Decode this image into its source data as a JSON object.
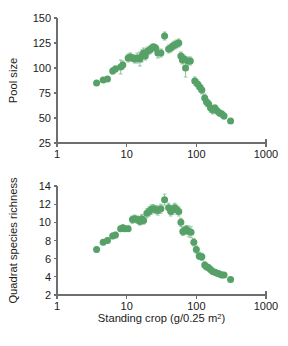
{
  "figure": {
    "background": "#ffffff",
    "marker_color": "#56a167",
    "error_bar_color": "#7fbb8c",
    "axis_color": "#6e6e6e"
  },
  "chart_data": [
    {
      "type": "scatter",
      "panel": "top",
      "title": "",
      "xlabel": "",
      "ylabel": "Pool size",
      "xscale": "log",
      "yscale": "linear",
      "xlim": [
        1,
        1000
      ],
      "ylim": [
        25,
        150
      ],
      "xticks": [
        1,
        10,
        100,
        1000
      ],
      "xticklabels": [
        "1",
        "10",
        "100",
        "1000"
      ],
      "yticks": [
        25,
        50,
        75,
        100,
        125,
        150
      ],
      "yticklabels": [
        "25",
        "50",
        "75",
        "100",
        "125",
        "150"
      ],
      "grid": false,
      "legend": false,
      "error_bars": "vertical",
      "points": [
        {
          "x": 3.7,
          "y": 85,
          "yerr": 2
        },
        {
          "x": 4.6,
          "y": 88,
          "yerr": 2
        },
        {
          "x": 5.3,
          "y": 89,
          "yerr": 2
        },
        {
          "x": 6.3,
          "y": 97,
          "yerr": 3
        },
        {
          "x": 6.9,
          "y": 99,
          "yerr": 3
        },
        {
          "x": 8.2,
          "y": 101,
          "yerr": 7
        },
        {
          "x": 8.8,
          "y": 103,
          "yerr": 4
        },
        {
          "x": 10.5,
          "y": 110,
          "yerr": 4
        },
        {
          "x": 11.3,
          "y": 111,
          "yerr": 4
        },
        {
          "x": 12.1,
          "y": 110,
          "yerr": 3
        },
        {
          "x": 13.0,
          "y": 109,
          "yerr": 4
        },
        {
          "x": 14.2,
          "y": 110,
          "yerr": 5
        },
        {
          "x": 15.5,
          "y": 109,
          "yerr": 7
        },
        {
          "x": 16.5,
          "y": 112,
          "yerr": 6
        },
        {
          "x": 17.5,
          "y": 115,
          "yerr": 5
        },
        {
          "x": 18.5,
          "y": 112,
          "yerr": 4
        },
        {
          "x": 20.0,
          "y": 117,
          "yerr": 4
        },
        {
          "x": 21.5,
          "y": 118,
          "yerr": 4
        },
        {
          "x": 23.0,
          "y": 120,
          "yerr": 4
        },
        {
          "x": 24.5,
          "y": 121,
          "yerr": 3
        },
        {
          "x": 26.0,
          "y": 120,
          "yerr": 3
        },
        {
          "x": 28.0,
          "y": 115,
          "yerr": 5
        },
        {
          "x": 31.0,
          "y": 115,
          "yerr": 4
        },
        {
          "x": 35.0,
          "y": 132,
          "yerr": 4
        },
        {
          "x": 40.0,
          "y": 119,
          "yerr": 4
        },
        {
          "x": 43.0,
          "y": 120,
          "yerr": 4
        },
        {
          "x": 46.0,
          "y": 122,
          "yerr": 4
        },
        {
          "x": 49.0,
          "y": 123,
          "yerr": 4
        },
        {
          "x": 52.0,
          "y": 124,
          "yerr": 4
        },
        {
          "x": 56.0,
          "y": 125,
          "yerr": 4
        },
        {
          "x": 60.0,
          "y": 112,
          "yerr": 4
        },
        {
          "x": 63.0,
          "y": 108,
          "yerr": 4
        },
        {
          "x": 67.0,
          "y": 109,
          "yerr": 4
        },
        {
          "x": 70.0,
          "y": 100,
          "yerr": 9
        },
        {
          "x": 76.0,
          "y": 107,
          "yerr": 4
        },
        {
          "x": 82.0,
          "y": 107,
          "yerr": 4
        },
        {
          "x": 95.0,
          "y": 87,
          "yerr": 4
        },
        {
          "x": 104.0,
          "y": 84,
          "yerr": 4
        },
        {
          "x": 112.0,
          "y": 81,
          "yerr": 4
        },
        {
          "x": 120.0,
          "y": 78,
          "yerr": 4
        },
        {
          "x": 132.0,
          "y": 70,
          "yerr": 4
        },
        {
          "x": 140.0,
          "y": 66,
          "yerr": 4
        },
        {
          "x": 150.0,
          "y": 64,
          "yerr": 4
        },
        {
          "x": 160.0,
          "y": 60,
          "yerr": 4
        },
        {
          "x": 172.0,
          "y": 58,
          "yerr": 4
        },
        {
          "x": 185.0,
          "y": 60,
          "yerr": 3
        },
        {
          "x": 200.0,
          "y": 57,
          "yerr": 3
        },
        {
          "x": 215.0,
          "y": 55,
          "yerr": 3
        },
        {
          "x": 232.0,
          "y": 54,
          "yerr": 3
        },
        {
          "x": 250.0,
          "y": 52,
          "yerr": 3
        },
        {
          "x": 310.0,
          "y": 47,
          "yerr": 2
        }
      ]
    },
    {
      "type": "scatter",
      "panel": "bottom",
      "title": "",
      "xlabel": "Standing crop (g/0.25 m2)",
      "ylabel": "Quadrat species richness",
      "xscale": "log",
      "yscale": "linear",
      "xlim": [
        1,
        1000
      ],
      "ylim": [
        2,
        14
      ],
      "xticks": [
        1,
        10,
        100,
        1000
      ],
      "xticklabels": [
        "1",
        "10",
        "100",
        "1000"
      ],
      "yticks": [
        2,
        4,
        6,
        8,
        10,
        12,
        14
      ],
      "yticklabels": [
        "2",
        "4",
        "6",
        "8",
        "10",
        "12",
        "14"
      ],
      "grid": false,
      "legend": false,
      "error_bars": "vertical",
      "points": [
        {
          "x": 3.7,
          "y": 7.0,
          "yerr": 0.25
        },
        {
          "x": 4.6,
          "y": 7.8,
          "yerr": 0.25
        },
        {
          "x": 5.3,
          "y": 8.0,
          "yerr": 0.25
        },
        {
          "x": 6.3,
          "y": 8.5,
          "yerr": 0.3
        },
        {
          "x": 6.9,
          "y": 8.6,
          "yerr": 0.3
        },
        {
          "x": 8.2,
          "y": 9.3,
          "yerr": 0.3
        },
        {
          "x": 8.8,
          "y": 9.4,
          "yerr": 0.3
        },
        {
          "x": 9.4,
          "y": 9.3,
          "yerr": 0.3
        },
        {
          "x": 10.5,
          "y": 9.3,
          "yerr": 0.3
        },
        {
          "x": 12.1,
          "y": 10.3,
          "yerr": 0.4
        },
        {
          "x": 13.0,
          "y": 10.4,
          "yerr": 0.4
        },
        {
          "x": 14.2,
          "y": 10.3,
          "yerr": 0.4
        },
        {
          "x": 15.5,
          "y": 10.1,
          "yerr": 0.4
        },
        {
          "x": 16.5,
          "y": 10.4,
          "yerr": 0.45
        },
        {
          "x": 17.5,
          "y": 10.2,
          "yerr": 0.4
        },
        {
          "x": 19.5,
          "y": 11.0,
          "yerr": 0.5
        },
        {
          "x": 21.0,
          "y": 11.2,
          "yerr": 0.5
        },
        {
          "x": 22.5,
          "y": 11.4,
          "yerr": 0.5
        },
        {
          "x": 24.0,
          "y": 11.5,
          "yerr": 0.45
        },
        {
          "x": 26.0,
          "y": 11.4,
          "yerr": 0.45
        },
        {
          "x": 28.0,
          "y": 11.3,
          "yerr": 0.5
        },
        {
          "x": 31.0,
          "y": 11.5,
          "yerr": 0.5
        },
        {
          "x": 35.0,
          "y": 12.5,
          "yerr": 0.6
        },
        {
          "x": 40.0,
          "y": 11.6,
          "yerr": 0.5
        },
        {
          "x": 43.0,
          "y": 11.2,
          "yerr": 0.5
        },
        {
          "x": 46.0,
          "y": 11.4,
          "yerr": 0.5
        },
        {
          "x": 49.0,
          "y": 11.6,
          "yerr": 0.5
        },
        {
          "x": 52.0,
          "y": 11.4,
          "yerr": 0.5
        },
        {
          "x": 56.0,
          "y": 11.2,
          "yerr": 0.5
        },
        {
          "x": 60.0,
          "y": 10.0,
          "yerr": 0.45
        },
        {
          "x": 64.0,
          "y": 9.0,
          "yerr": 0.45
        },
        {
          "x": 68.0,
          "y": 9.1,
          "yerr": 0.45
        },
        {
          "x": 72.0,
          "y": 9.2,
          "yerr": 0.45
        },
        {
          "x": 78.0,
          "y": 9.0,
          "yerr": 0.6
        },
        {
          "x": 84.0,
          "y": 8.9,
          "yerr": 0.6
        },
        {
          "x": 92.0,
          "y": 7.8,
          "yerr": 0.4
        },
        {
          "x": 100.0,
          "y": 7.0,
          "yerr": 0.4
        },
        {
          "x": 110.0,
          "y": 6.3,
          "yerr": 0.4
        },
        {
          "x": 120.0,
          "y": 6.2,
          "yerr": 0.4
        },
        {
          "x": 132.0,
          "y": 5.3,
          "yerr": 0.35
        },
        {
          "x": 140.0,
          "y": 5.1,
          "yerr": 0.35
        },
        {
          "x": 150.0,
          "y": 5.0,
          "yerr": 0.35
        },
        {
          "x": 160.0,
          "y": 4.8,
          "yerr": 0.3
        },
        {
          "x": 172.0,
          "y": 4.6,
          "yerr": 0.3
        },
        {
          "x": 185.0,
          "y": 4.5,
          "yerr": 0.3
        },
        {
          "x": 200.0,
          "y": 4.4,
          "yerr": 0.3
        },
        {
          "x": 215.0,
          "y": 4.3,
          "yerr": 0.3
        },
        {
          "x": 232.0,
          "y": 4.2,
          "yerr": 0.3
        },
        {
          "x": 250.0,
          "y": 4.2,
          "yerr": 0.25
        },
        {
          "x": 310.0,
          "y": 3.7,
          "yerr": 0.2
        }
      ]
    }
  ]
}
